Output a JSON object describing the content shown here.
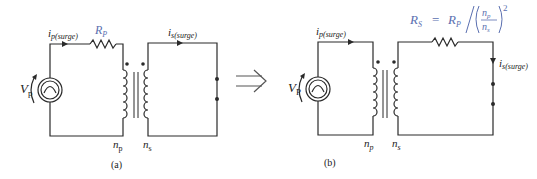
{
  "diagram": {
    "type": "circuit",
    "panels": [
      {
        "id": "a",
        "caption": "(a)",
        "source_label": "V",
        "source_label_sub": "p",
        "primary_current_label": "i",
        "primary_current_sub": "p(surge)",
        "resistor_label": "R",
        "resistor_label_sub": "P",
        "primary_turns_label": "n",
        "primary_turns_sub": "p",
        "secondary_turns_label": "n",
        "secondary_turns_sub": "s",
        "secondary_current_label": "i",
        "secondary_current_sub": "s(surge)"
      },
      {
        "id": "b",
        "caption": "(b)",
        "source_label": "V",
        "source_label_sub": "P",
        "primary_current_label": "i",
        "primary_current_sub": "p(surge)",
        "resistor_formula": {
          "lhs": "R",
          "lhs_sub": "S",
          "eq": " = ",
          "rhs": "R",
          "rhs_sub": "P",
          "num": "n",
          "num_sub": "p",
          "den": "n",
          "den_sub": "s",
          "exponent": "2"
        },
        "primary_turns_label": "n",
        "primary_turns_sub": "p",
        "secondary_turns_label": "n",
        "secondary_turns_sub": "s",
        "secondary_current_label": "i",
        "secondary_current_sub": "s(surge)"
      }
    ],
    "transform_arrow": "⇒",
    "colors": {
      "wire": "#2a2a2a",
      "accent_label": "#5a6fb0"
    }
  }
}
